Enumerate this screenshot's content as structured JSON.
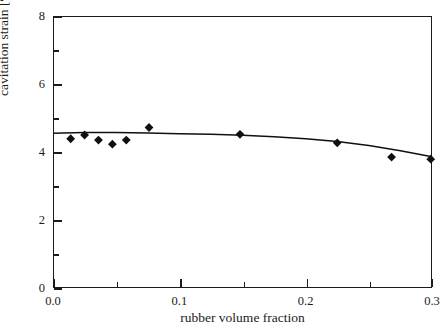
{
  "chart_data": {
    "type": "scatter",
    "title": "",
    "xlabel": "rubber volume fraction",
    "ylabel": "cavitation strain [%]",
    "xlim": [
      0.0,
      0.3
    ],
    "ylim": [
      0,
      8
    ],
    "grid": false,
    "legend": null,
    "x_ticks": [
      "0.0",
      "0.1",
      "0.2",
      "0.3"
    ],
    "x_tick_values": [
      0.0,
      0.1,
      0.2,
      0.3
    ],
    "x_minor_tick_values": [
      0.05,
      0.15,
      0.25
    ],
    "y_ticks": [
      "0",
      "2",
      "4",
      "6",
      "8"
    ],
    "y_tick_values": [
      0,
      2,
      4,
      6,
      8
    ],
    "y_minor_tick_values": [
      1,
      3,
      5,
      7
    ],
    "marker": "filled-diamond",
    "marker_color": "#101010",
    "line_color": "#101010",
    "series": [
      {
        "name": "cavitation strain data",
        "type": "scatter",
        "x": [
          0.014,
          0.025,
          0.036,
          0.047,
          0.058,
          0.076,
          0.148,
          0.225,
          0.268,
          0.299
        ],
        "y": [
          4.39,
          4.5,
          4.35,
          4.23,
          4.35,
          4.72,
          4.52,
          4.27,
          3.85,
          3.79
        ]
      },
      {
        "name": "fitted curve",
        "type": "line",
        "x": [
          0.0,
          0.025,
          0.05,
          0.075,
          0.1,
          0.125,
          0.15,
          0.175,
          0.2,
          0.225,
          0.25,
          0.275,
          0.3
        ],
        "y": [
          4.55,
          4.57,
          4.57,
          4.56,
          4.54,
          4.52,
          4.49,
          4.45,
          4.39,
          4.31,
          4.19,
          4.04,
          3.86
        ]
      }
    ]
  },
  "axes": {
    "y_title": "cavitation strain [%]",
    "x_title": "rubber volume fraction"
  }
}
